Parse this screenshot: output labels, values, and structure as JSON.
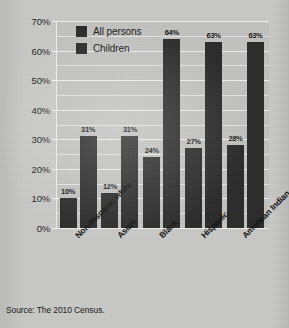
{
  "chart_data": {
    "type": "bar",
    "title": "",
    "subtitle": "",
    "xlabel": "",
    "ylabel": "",
    "ylim": [
      0,
      70
    ],
    "ytick_labels": [
      "0%",
      "10%",
      "20%",
      "30%",
      "40%",
      "50%",
      "60%",
      "70%"
    ],
    "ytick_values": [
      0,
      10,
      20,
      30,
      40,
      50,
      60,
      70
    ],
    "ytick_step": 10,
    "gridline_step": 5,
    "grid": true,
    "legend_position": "top-left inside plot",
    "categories": [
      "Non-Hispanic white",
      "Asian",
      "Black",
      "Hispanic",
      "American Indian"
    ],
    "series": [
      {
        "name": "All persons",
        "color": "#2b2b2b",
        "values": [
          10,
          12,
          24,
          27,
          28
        ],
        "value_labels": [
          "10%",
          "12%",
          "24%",
          "27%",
          "28%"
        ]
      },
      {
        "name": "Children",
        "color": "#2b2b2b",
        "values": [
          31,
          31,
          64,
          63,
          63
        ],
        "value_labels": [
          "31%",
          "31%",
          "64%",
          "63%",
          "63%"
        ]
      }
    ],
    "source_note": "Source: The 2010 Census."
  },
  "legend": {
    "items": [
      {
        "label": "All persons",
        "color": "#2b2b2b"
      },
      {
        "label": "Children",
        "color": "#2b2b2b"
      }
    ]
  },
  "footer": {
    "source": "Source: The 2010 Census."
  },
  "colors": {
    "background": "#c9c9c7",
    "plot_background": "#c2c2c0",
    "bar": "#2b2b2b",
    "gridline": "#eeeeec",
    "text": "#151515"
  }
}
